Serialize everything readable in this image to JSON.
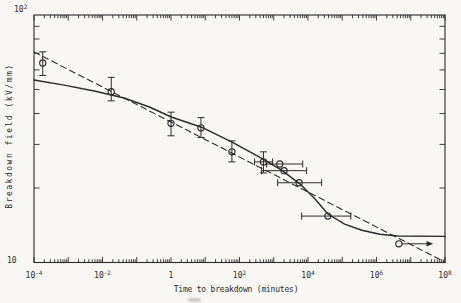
{
  "colors": {
    "background": "#f8f7f4",
    "ink": "#2b2b2b"
  },
  "chart_data": {
    "type": "scatter",
    "title": "",
    "xlabel": "Time to breakdown (minutes)",
    "ylabel": "Breakdown field (kV/mm)",
    "x_scale": "log",
    "y_scale": "log",
    "xlim": [
      0.0001,
      100000000.0
    ],
    "ylim": [
      10,
      100
    ],
    "grid": false,
    "legend": false,
    "x_ticks": [
      {
        "exp": -4,
        "base": "10",
        "sup": "-4"
      },
      {
        "exp": -2,
        "base": "10",
        "sup": "-2"
      },
      {
        "exp": 0,
        "base": "1",
        "sup": ""
      },
      {
        "exp": 2,
        "base": "10",
        "sup": "2"
      },
      {
        "exp": 4,
        "base": "10",
        "sup": "4"
      },
      {
        "exp": 6,
        "base": "10",
        "sup": "6"
      },
      {
        "exp": 8,
        "base": "10",
        "sup": "8"
      }
    ],
    "y_ticks": [
      {
        "exp": 2,
        "base": "10",
        "sup": "2"
      },
      {
        "exp": 1,
        "base": "10",
        "sup": ""
      }
    ],
    "points": [
      {
        "t": 0.00018,
        "E": 64,
        "E_err": [
          57,
          71
        ]
      },
      {
        "t": 0.018,
        "E": 49,
        "E_err": [
          45,
          56
        ]
      },
      {
        "t": 1.0,
        "E": 36.5,
        "E_err": [
          32.5,
          40.5
        ]
      },
      {
        "t": 7.5,
        "E": 35,
        "E_err": [
          32,
          38.5
        ]
      },
      {
        "t": 60,
        "E": 28,
        "E_err": [
          25.5,
          31
        ]
      },
      {
        "t": 500,
        "E": 25.5,
        "E_err": [
          23,
          28
        ],
        "t_err": [
          275,
          925
        ]
      },
      {
        "t": 1500,
        "E": 25,
        "t_err": [
          620,
          7000
        ]
      },
      {
        "t": 2000,
        "E": 23.5,
        "t_err": [
          440,
          9100
        ]
      },
      {
        "t": 5500,
        "E": 21,
        "t_err": [
          1300,
          25000
        ]
      },
      {
        "t": 38000.0,
        "E": 15.4,
        "t_err": [
          6500,
          178000
        ]
      },
      {
        "t": 4500000.0,
        "E": 11.9,
        "arrow_to": 45000000.0
      }
    ],
    "series": [
      {
        "name": "model curve",
        "style": "solid",
        "points_logt_E": [
          [
            -4,
            54.6
          ],
          [
            -3.12,
            52.1
          ],
          [
            -2.24,
            49.3
          ],
          [
            -1.37,
            46.2
          ],
          [
            -0.63,
            42.5
          ],
          [
            0.01,
            38.7
          ],
          [
            0.89,
            35.2
          ],
          [
            1.77,
            30.7
          ],
          [
            2.64,
            26.4
          ],
          [
            3.23,
            23.6
          ],
          [
            3.76,
            20.8
          ],
          [
            4.2,
            18.1
          ],
          [
            4.58,
            15.7
          ],
          [
            5.07,
            14.3
          ],
          [
            5.57,
            13.5
          ],
          [
            6.1,
            13.0
          ],
          [
            6.62,
            12.8
          ],
          [
            8,
            12.75
          ]
        ]
      },
      {
        "name": "inverse power-law fit",
        "style": "dashed",
        "points_logt_E": [
          [
            -4,
            70.9
          ],
          [
            8,
            10.05
          ]
        ]
      }
    ]
  }
}
